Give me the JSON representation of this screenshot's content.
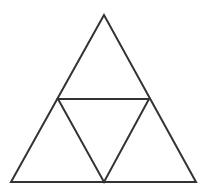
{
  "diagram": {
    "type": "subdivided-equilateral-triangle",
    "stroke_color": "#333333",
    "background_color": "#ffffff",
    "stroke_width": 2,
    "vertices": {
      "apex": [
        104,
        15
      ],
      "bottom_left": [
        11,
        182
      ],
      "bottom_right": [
        196,
        182
      ],
      "mid_left": [
        58,
        99
      ],
      "mid_right": [
        149,
        99
      ],
      "mid_bottom": [
        104,
        182
      ]
    },
    "outer_triangle_points": "104,15 11,182 196,182",
    "inner_triangle_points": "58,99 149,99 104,182"
  }
}
